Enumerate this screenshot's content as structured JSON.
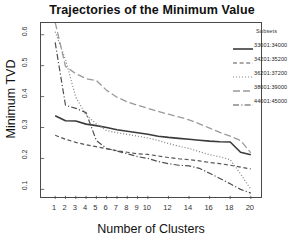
{
  "chart_data": {
    "type": "line",
    "title": "Trajectories of the Minimum Value",
    "xlabel": "Number of Clusters",
    "ylabel": "Minimum TVD",
    "xlim": [
      0.4,
      20.6
    ],
    "ylim": [
      0.085,
      0.625
    ],
    "grid": false,
    "legend_position": "top-right-outside",
    "legend_title": "Subsets",
    "xticks": [
      1,
      2,
      3,
      4,
      5,
      6,
      7,
      8,
      9,
      10,
      12,
      14,
      16,
      18,
      20
    ],
    "xtick_labels": [
      "1",
      "2",
      "3",
      "4",
      "5",
      "6",
      "7",
      "8",
      "9",
      "10",
      "12",
      "14",
      "16",
      "18",
      "20"
    ],
    "yticks": [
      0.1,
      0.2,
      0.3,
      0.4,
      0.5,
      0.6
    ],
    "ytick_labels": [
      "0.1",
      "0.2",
      "0.3",
      "0.4",
      "0.5",
      "0.6"
    ],
    "x": [
      1,
      2,
      3,
      4,
      5,
      6,
      7,
      8,
      9,
      10,
      11,
      12,
      13,
      14,
      15,
      16,
      17,
      18,
      19,
      20
    ],
    "series": [
      {
        "name": "33001:34000",
        "dash": "solid",
        "color": "#3a3a3a",
        "width": 1.6,
        "values": [
          0.338,
          0.322,
          0.321,
          0.311,
          0.306,
          0.3,
          0.293,
          0.288,
          0.283,
          0.278,
          0.272,
          0.268,
          0.265,
          0.262,
          0.259,
          0.256,
          0.254,
          0.253,
          0.22,
          0.212
        ]
      },
      {
        "name": "34201:35200",
        "dash": "dashed",
        "color": "#555555",
        "width": 1.2,
        "values": [
          0.275,
          0.262,
          0.252,
          0.244,
          0.238,
          0.231,
          0.225,
          0.22,
          0.215,
          0.213,
          0.208,
          0.203,
          0.199,
          0.196,
          0.192,
          0.187,
          0.183,
          0.178,
          0.172,
          0.166
        ]
      },
      {
        "name": "36201:37200",
        "dash": "dotted",
        "color": "#8a8a8a",
        "width": 1.2,
        "values": [
          0.61,
          0.52,
          0.398,
          0.34,
          0.312,
          0.29,
          0.283,
          0.278,
          0.272,
          0.266,
          0.258,
          0.248,
          0.24,
          0.232,
          0.222,
          0.212,
          0.205,
          0.196,
          0.15,
          0.1
        ]
      },
      {
        "name": "38001:39000",
        "dash": "longdash",
        "color": "#9a9a9a",
        "width": 1.3,
        "values": [
          0.64,
          0.498,
          0.474,
          0.458,
          0.452,
          0.42,
          0.398,
          0.383,
          0.372,
          0.362,
          0.352,
          0.343,
          0.334,
          0.325,
          0.312,
          0.298,
          0.284,
          0.272,
          0.258,
          0.218
        ]
      },
      {
        "name": "44001:45000",
        "dash": "dashdot",
        "color": "#4f4f4f",
        "width": 1.2,
        "values": [
          0.575,
          0.372,
          0.362,
          0.348,
          0.258,
          0.232,
          0.224,
          0.215,
          0.206,
          0.2,
          0.19,
          0.183,
          0.178,
          0.176,
          0.168,
          0.152,
          0.135,
          0.118,
          0.1,
          0.088
        ]
      }
    ]
  },
  "axes": {
    "ylabel": "Minimum TVD",
    "xlabel": "Number of Clusters"
  },
  "legend": {
    "title": "Subsets",
    "entries": [
      {
        "label": "33001:34000"
      },
      {
        "label": "34201:35200"
      },
      {
        "label": "36201:37200"
      },
      {
        "label": "38001:39000"
      },
      {
        "label": "44001:45000"
      }
    ]
  },
  "title": {
    "text": "Trajectories of the Minimum Value"
  },
  "colors": {
    "axis": "#4a4a4a",
    "text": "#111111",
    "background": "#ffffff"
  }
}
